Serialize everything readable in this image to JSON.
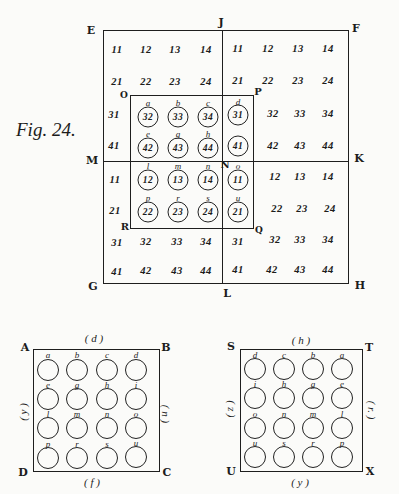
{
  "figure_label": "Fig. 24.",
  "top_diagram": {
    "corners": {
      "E": "E",
      "F": "F",
      "G": "G",
      "H": "H",
      "J": "J",
      "L": "L",
      "M": "M",
      "K": "K",
      "O": "O",
      "P": "P",
      "R": "R",
      "Q": "Q",
      "N": "N"
    },
    "grid": [
      [
        "11",
        "12",
        "13",
        "14",
        "11",
        "12",
        "13",
        "14"
      ],
      [
        "21",
        "22",
        "23",
        "24",
        "21",
        "22",
        "23",
        "24"
      ],
      [
        "31",
        "32",
        "33",
        "34",
        "31",
        "32",
        "33",
        "34"
      ],
      [
        "41",
        "42",
        "43",
        "44",
        "41",
        "42",
        "43",
        "44"
      ],
      [
        "11",
        "12",
        "13",
        "14",
        "11",
        "12",
        "13",
        "14"
      ],
      [
        "21",
        "22",
        "23",
        "24",
        "21",
        "22",
        "23",
        "24"
      ],
      [
        "31",
        "32",
        "33",
        "34",
        "31",
        "32",
        "33",
        "34"
      ],
      [
        "41",
        "42",
        "43",
        "44",
        "41",
        "42",
        "43",
        "44"
      ]
    ],
    "circled_cells": [
      {
        "row": 2,
        "col": 1,
        "letter": "a",
        "value": "32"
      },
      {
        "row": 2,
        "col": 2,
        "letter": "b",
        "value": "33"
      },
      {
        "row": 2,
        "col": 3,
        "letter": "c",
        "value": "34"
      },
      {
        "row": 2,
        "col": 4,
        "letter": "d",
        "value": "31"
      },
      {
        "row": 3,
        "col": 1,
        "letter": "e",
        "value": "42"
      },
      {
        "row": 3,
        "col": 2,
        "letter": "g",
        "value": "43"
      },
      {
        "row": 3,
        "col": 3,
        "letter": "h",
        "value": "44"
      },
      {
        "row": 3,
        "col": 4,
        "letter": "i",
        "value": "41"
      },
      {
        "row": 4,
        "col": 1,
        "letter": "l",
        "value": "12"
      },
      {
        "row": 4,
        "col": 2,
        "letter": "m",
        "value": "13"
      },
      {
        "row": 4,
        "col": 3,
        "letter": "n",
        "value": "14"
      },
      {
        "row": 4,
        "col": 4,
        "letter": "o",
        "value": "11"
      },
      {
        "row": 5,
        "col": 1,
        "letter": "p",
        "value": "22"
      },
      {
        "row": 5,
        "col": 2,
        "letter": "r",
        "value": "23"
      },
      {
        "row": 5,
        "col": 3,
        "letter": "s",
        "value": "24"
      },
      {
        "row": 5,
        "col": 4,
        "letter": "u",
        "value": "21"
      }
    ]
  },
  "bottom_left": {
    "corners": {
      "A": "A",
      "B": "B",
      "C": "C",
      "D": "D"
    },
    "sides": {
      "top": "( d )",
      "bottom": "( f )",
      "left": "( y )",
      "right": "( n )"
    },
    "letters": [
      [
        "a",
        "b",
        "c",
        "d"
      ],
      [
        "e",
        "g",
        "h",
        "i"
      ],
      [
        "l",
        "m",
        "n",
        "o"
      ],
      [
        "p",
        "r",
        "s",
        "u"
      ]
    ]
  },
  "bottom_right": {
    "corners": {
      "S": "S",
      "T": "T",
      "U": "U",
      "X": "X"
    },
    "sides": {
      "top": "( h )",
      "bottom": "( y )",
      "left": "( z )",
      "right": "( r. )"
    },
    "letters": [
      [
        "d",
        "c",
        "b",
        "a"
      ],
      [
        "i",
        "h",
        "g",
        "e"
      ],
      [
        "o",
        "n",
        "m",
        "l"
      ],
      [
        "u",
        "s",
        "r",
        "p"
      ]
    ]
  }
}
